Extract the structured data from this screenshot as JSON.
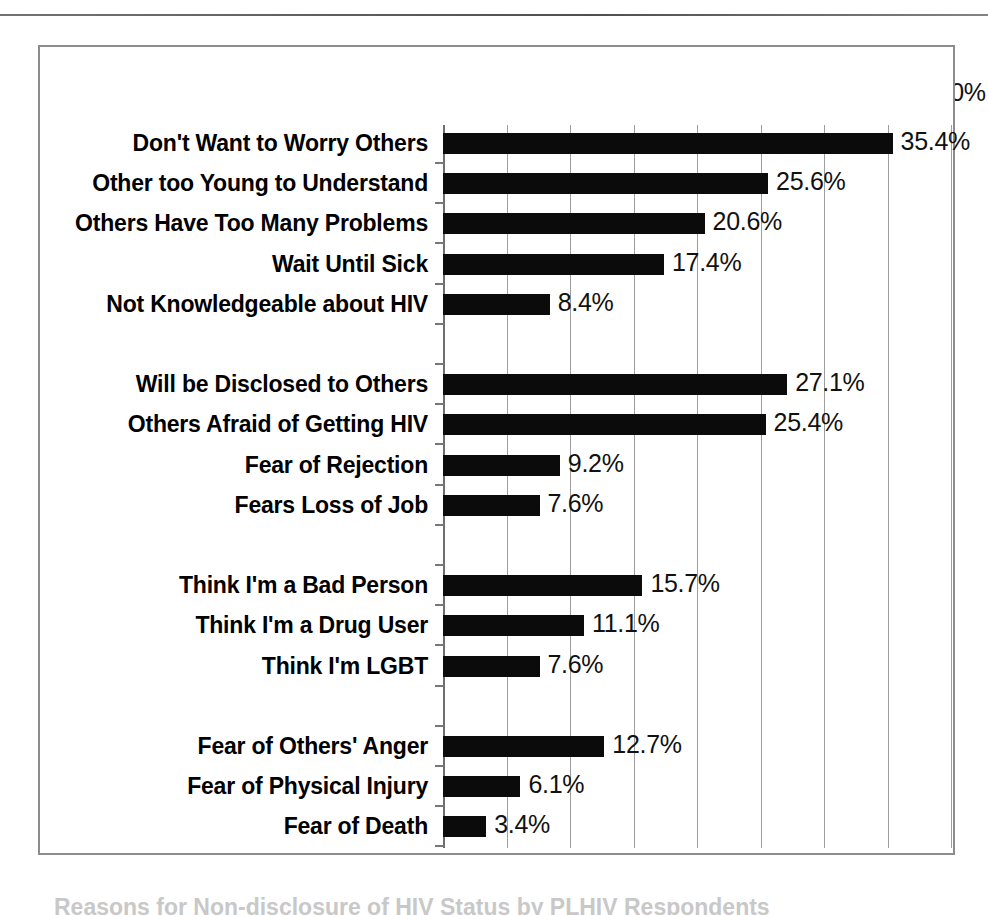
{
  "chart_data": {
    "type": "bar",
    "orientation": "horizontal",
    "title": "",
    "xlabel": "",
    "ylabel": "",
    "xlim": [
      0,
      40
    ],
    "xtick_labels": [
      "0.0%",
      "5.0%",
      "10.0%",
      "15.0%",
      "20.0%",
      "25.0%",
      "30.0%",
      "35.0%",
      "40.0%"
    ],
    "xticks": [
      0,
      5,
      10,
      15,
      20,
      25,
      30,
      35,
      40
    ],
    "grid": true,
    "legend": "none",
    "axis_label_position": "top",
    "bar_color": "#0b0b0b",
    "categories": [
      "Don't Want to Worry Others",
      "Other too Young to Understand",
      "Others Have Too Many Problems",
      "Wait Until Sick",
      "Not Knowledgeable about HIV",
      "",
      "Will be Disclosed to Others",
      "Others Afraid of Getting HIV",
      "Fear of Rejection",
      "Fears Loss of Job",
      "",
      "Think I'm a Bad Person",
      "Think I'm a Drug User",
      "Think I'm LGBT",
      "",
      "Fear of Others' Anger",
      "Fear of Physical Injury",
      "Fear of Death"
    ],
    "values": [
      35.4,
      25.6,
      20.6,
      17.4,
      8.4,
      null,
      27.1,
      25.4,
      9.2,
      7.6,
      null,
      15.7,
      11.1,
      7.6,
      null,
      12.7,
      6.1,
      3.4
    ],
    "data_labels": [
      "35.4%",
      "25.6%",
      "20.6%",
      "17.4%",
      "8.4%",
      "",
      "27.1%",
      "25.4%",
      "9.2%",
      "7.6%",
      "",
      "15.7%",
      "11.1%",
      "7.6%",
      "",
      "12.7%",
      "6.1%",
      "3.4%"
    ],
    "groups": [
      {
        "name": "",
        "categories": [
          "Don't Want to Worry Others",
          "Other too Young to Understand",
          "Others Have Too Many Problems",
          "Wait Until Sick",
          "Not Knowledgeable about HIV"
        ]
      },
      {
        "name": "",
        "categories": [
          "Will be Disclosed to Others",
          "Others Afraid of Getting HIV",
          "Fear of Rejection",
          "Fears Loss of Job"
        ]
      },
      {
        "name": "",
        "categories": [
          "Think I'm a Bad Person",
          "Think I'm a Drug User",
          "Think I'm LGBT"
        ]
      },
      {
        "name": "",
        "categories": [
          "Fear of Others' Anger",
          "Fear of Physical Injury",
          "Fear of Death"
        ]
      }
    ]
  },
  "caption": {
    "text": "Reasons for Non-disclosure of HIV Status by PLHIV Respondents"
  }
}
